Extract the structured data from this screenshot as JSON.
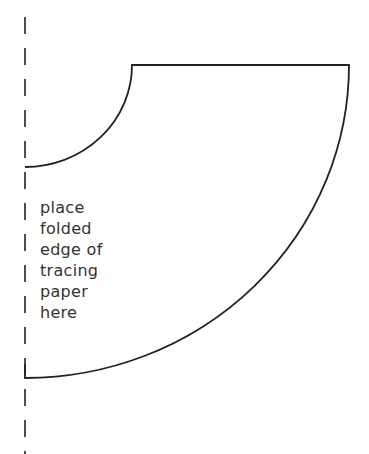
{
  "diagram": {
    "type": "sewing-pattern",
    "shape": "quarter-circle annulus (skirt pattern piece)",
    "fold_line": {
      "style": "dashed",
      "x": 25,
      "color": "#222222"
    },
    "label_lines": [
      "place",
      "folded",
      "edge of",
      "tracing",
      "paper",
      "here"
    ],
    "stroke_color": "#222222",
    "text_color": "#333333"
  }
}
